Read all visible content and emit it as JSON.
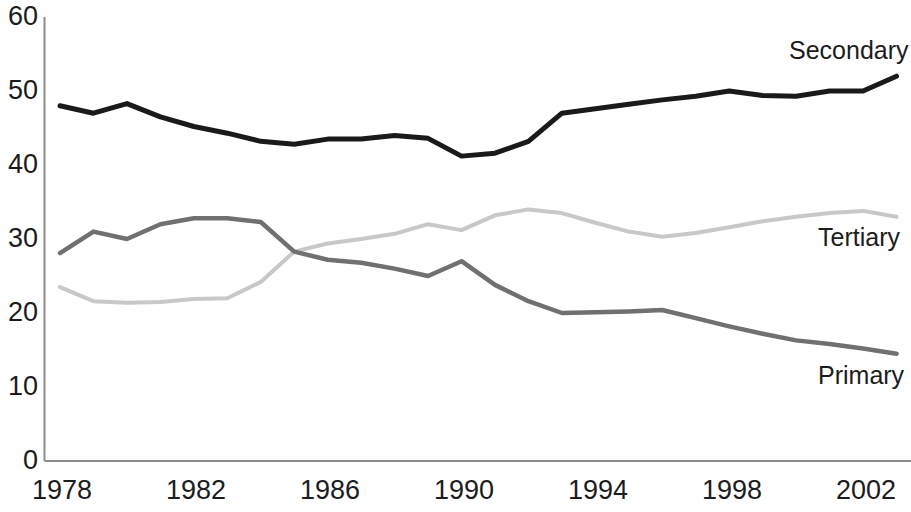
{
  "chart_data": {
    "type": "line",
    "title": "",
    "subtitle": "",
    "xlabel": "",
    "ylabel": "",
    "xlim": [
      1978,
      2003
    ],
    "ylim": [
      0,
      60
    ],
    "grid": false,
    "legend_position": "inline-right-end-of-series",
    "y_ticks": [
      "0",
      "10",
      "20",
      "30",
      "40",
      "50",
      "60"
    ],
    "y_tick_values": [
      0,
      10,
      20,
      30,
      40,
      50,
      60
    ],
    "x_ticks": [
      "1978",
      "1982",
      "1986",
      "1990",
      "1994",
      "1998",
      "2002"
    ],
    "x_tick_values": [
      1978,
      1982,
      1986,
      1990,
      1994,
      1998,
      2002
    ],
    "x": [
      1978,
      1979,
      1980,
      1981,
      1982,
      1983,
      1984,
      1985,
      1986,
      1987,
      1988,
      1989,
      1990,
      1991,
      1992,
      1993,
      1994,
      1995,
      1996,
      1997,
      1998,
      1999,
      2000,
      2001,
      2002,
      2003
    ],
    "series": [
      {
        "name": "Secondary",
        "color": "#1a1a1a",
        "line_width": 5,
        "label_x": 2000.6,
        "label_y": 56.5,
        "values": [
          48.0,
          47.0,
          48.3,
          46.5,
          45.2,
          44.3,
          43.2,
          42.8,
          43.5,
          43.5,
          44.0,
          43.6,
          41.2,
          41.6,
          43.2,
          47.0,
          47.6,
          48.2,
          48.8,
          49.3,
          50.0,
          49.4,
          49.3,
          50.0,
          50.0,
          52.0
        ]
      },
      {
        "name": "Tertiary",
        "color": "#c8c8c8",
        "line_width": 4,
        "label_x": 2000.3,
        "label_y": 28.2,
        "values": [
          23.5,
          21.6,
          21.4,
          21.5,
          21.9,
          22.0,
          24.2,
          28.3,
          29.4,
          30.0,
          30.7,
          32.0,
          31.2,
          33.2,
          34.0,
          33.5,
          32.2,
          31.0,
          30.3,
          30.8,
          31.6,
          32.4,
          33.0,
          33.5,
          33.8,
          33.0
        ]
      },
      {
        "name": "Primary",
        "color": "#707070",
        "line_width": 4.5,
        "label_x": 2000.3,
        "label_y": 11.5,
        "values": [
          28.1,
          31.0,
          30.0,
          32.0,
          32.8,
          32.8,
          32.3,
          28.3,
          27.2,
          26.8,
          26.0,
          25.0,
          27.0,
          23.8,
          21.6,
          20.0,
          20.1,
          20.2,
          20.4,
          19.3,
          18.2,
          17.2,
          16.3,
          15.8,
          15.2,
          14.5
        ]
      }
    ]
  },
  "axis": {
    "axis_color": "#8c8c8c",
    "text_color": "#1c1c1c"
  }
}
